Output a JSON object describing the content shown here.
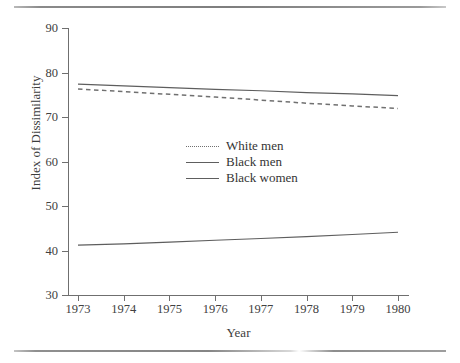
{
  "figure": {
    "type": "line-chart",
    "has_top_rule": true,
    "has_bottom_rule": true
  },
  "axes": {
    "x_title": "Year",
    "y_title": "Index of Dissimilarity",
    "x_ticks": [
      "1973",
      "1974",
      "1975",
      "1976",
      "1977",
      "1978",
      "1979",
      "1980"
    ],
    "y_ticks": [
      "90",
      "80",
      "70",
      "60",
      "50",
      "40",
      "30"
    ]
  },
  "legend": {
    "items": [
      {
        "label": "White men",
        "style": "dashed",
        "color": "#707070"
      },
      {
        "label": "Black men",
        "style": "solid",
        "color": "#5e5e5e"
      },
      {
        "label": "Black women",
        "style": "solid",
        "color": "#5e5e5e"
      }
    ]
  },
  "chart_data": {
    "type": "line",
    "title": "",
    "xlabel": "Year",
    "ylabel": "Index of Dissimilarity",
    "x": [
      1973,
      1974,
      1975,
      1976,
      1977,
      1978,
      1979,
      1980
    ],
    "xlim": [
      1973,
      1980
    ],
    "ylim": [
      30,
      90
    ],
    "yticks": [
      30,
      40,
      50,
      60,
      70,
      80,
      90
    ],
    "xticks": [
      1973,
      1974,
      1975,
      1976,
      1977,
      1978,
      1979,
      1980
    ],
    "grid": false,
    "legend_position": "center",
    "series": [
      {
        "name": "White men",
        "style": "dashed",
        "color": "#707070",
        "values": [
          76.3,
          75.7,
          75.1,
          74.5,
          73.8,
          73.1,
          72.5,
          71.9
        ]
      },
      {
        "name": "Black men",
        "style": "solid",
        "color": "#5e5e5e",
        "values": [
          77.4,
          77.0,
          76.6,
          76.2,
          75.9,
          75.5,
          75.2,
          74.8
        ]
      },
      {
        "name": "Black women",
        "style": "solid",
        "color": "#5e5e5e",
        "values": [
          41.2,
          41.5,
          41.9,
          42.3,
          42.7,
          43.1,
          43.6,
          44.1
        ]
      }
    ]
  }
}
